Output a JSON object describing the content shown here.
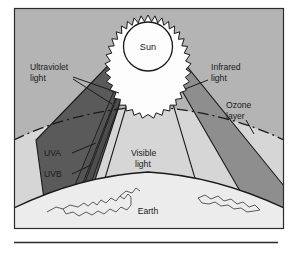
{
  "figure": {
    "title": "",
    "caption_rule": true,
    "frame": {
      "x": 14,
      "y": 8,
      "width": 270,
      "height": 221
    }
  },
  "colors": {
    "sky": "#b4b4b4",
    "stratosphere": "#d6d6d6",
    "earth_surface": "#ececec",
    "uv_beam": "#5a5a5a",
    "infrared_beam": "#8e8e8e",
    "visible_beam": "#b4b4b4",
    "sun_disc": "#fdfdfd",
    "outline": "#1a1a1a",
    "text": "#1a1a1a",
    "page": "#ffffff",
    "rule": "#2b2b2b"
  },
  "labels": {
    "sun": "Sun",
    "ultraviolet_light": "Ultraviolet\nlight",
    "ultraviolet_light_line1": "Ultraviolet",
    "ultraviolet_light_line2": "light",
    "infrared_light_line1": "Infrared",
    "infrared_light_line2": "light",
    "ozone_layer_line1": "Ozone",
    "ozone_layer_line2": "layer",
    "visible_light_line1": "Visible",
    "visible_light_line2": "light",
    "uva": "UVA",
    "uvb": "UVB",
    "earth": "Earth"
  },
  "icons": {
    "sun": "sun-icon",
    "ozone_arc": "ozone-layer-arc-icon",
    "earth_arc": "earth-horizon-arc-icon",
    "coastline": "coastline-outline-icon"
  },
  "diagram": {
    "type": "schematic-cross-section",
    "beams": [
      {
        "name": "ultraviolet",
        "label": "Ultraviolet light",
        "shade": "dark",
        "sublabels": [
          "UVA",
          "UVB"
        ]
      },
      {
        "name": "visible",
        "label": "Visible light",
        "shade": "none"
      },
      {
        "name": "infrared",
        "label": "Infrared light",
        "shade": "medium"
      }
    ],
    "layers": [
      {
        "name": "ozone layer",
        "label": "Ozone layer",
        "style": "dash-dot-arc"
      },
      {
        "name": "earth",
        "label": "Earth",
        "style": "solid-arc"
      }
    ]
  }
}
